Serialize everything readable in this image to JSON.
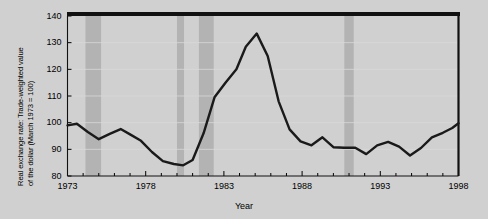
{
  "figure": {
    "background_color": "#d0d0d0",
    "plot_background_color": "#ffffff",
    "line_color": "#1a1a1a",
    "band_color": "#b3b3b3",
    "grid_color": "#d8d8d8",
    "axis_color": "#000000"
  },
  "chart_data": {
    "type": "line",
    "title": "",
    "ylabel_line1": "Real exchange rate: Trade-weighted value",
    "ylabel_line2": "of the dollar (March 1973 = 100)",
    "xlabel": "Year",
    "xlim": [
      1973,
      1998
    ],
    "ylim": [
      80,
      140
    ],
    "yticks": [
      80,
      90,
      100,
      110,
      120,
      130,
      140
    ],
    "ytick_labels": [
      "80",
      "90",
      "100",
      "110",
      "120",
      "130",
      "140"
    ],
    "xticks": [
      1973,
      1978,
      1983,
      1988,
      1993,
      1998
    ],
    "xtick_labels": [
      "1973",
      "1978",
      "1983",
      "1988",
      "1993",
      "1998"
    ],
    "xtick_minor_step": 1,
    "grid": "horizontal",
    "legend": "none",
    "series": [
      {
        "name": "Real trade-weighted value of the dollar",
        "x": [
          1973.0,
          1973.6,
          1974.3,
          1975.0,
          1975.7,
          1976.4,
          1977.0,
          1977.7,
          1978.4,
          1979.1,
          1979.8,
          1980.4,
          1981.0,
          1981.7,
          1982.4,
          1983.1,
          1983.8,
          1984.4,
          1985.1,
          1985.8,
          1986.5,
          1987.2,
          1987.9,
          1988.6,
          1989.3,
          1990.0,
          1990.7,
          1991.4,
          1992.1,
          1992.8,
          1993.5,
          1994.2,
          1994.9,
          1995.6,
          1996.3,
          1997.0,
          1997.6,
          1998.0
        ],
        "y": [
          99.0,
          99.6,
          96.5,
          93.8,
          95.8,
          97.6,
          95.6,
          93.2,
          89.0,
          85.6,
          84.5,
          84.0,
          86.0,
          96.0,
          109.5,
          115.0,
          120.0,
          128.5,
          133.4,
          125.0,
          108.0,
          97.5,
          93.0,
          91.5,
          94.5,
          90.8,
          90.6,
          90.6,
          88.2,
          91.5,
          92.8,
          91.0,
          87.7,
          90.5,
          94.5,
          96.2,
          98.0,
          99.8
        ]
      }
    ],
    "recession_bands": [
      {
        "start": 1974.15,
        "end": 1975.15
      },
      {
        "start": 1980.0,
        "end": 1980.45
      },
      {
        "start": 1981.4,
        "end": 1982.35
      },
      {
        "start": 1990.7,
        "end": 1991.3
      }
    ]
  }
}
